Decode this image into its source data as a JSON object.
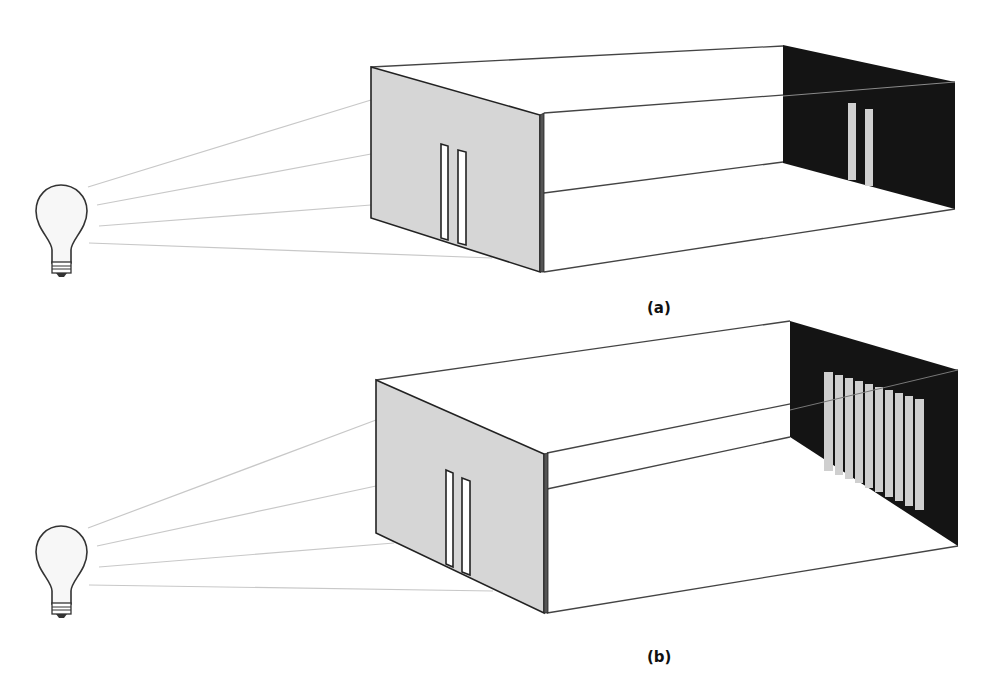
{
  "figure": {
    "panels": [
      {
        "id": "a",
        "label": "(a)",
        "front_barrier_slits": 2,
        "back_screen_bright_bands": 2,
        "description": "Light bulb illuminating a double-slit barrier; the back screen shows two bright bands"
      },
      {
        "id": "b",
        "label": "(b)",
        "front_barrier_slits": 2,
        "back_screen_bright_bands": 9,
        "description": "Light bulb illuminating a double-slit barrier; the back screen shows an interference pattern of many bands"
      }
    ],
    "colors": {
      "barrier": "#d6d6d6",
      "barrier_edge": "#2a2a2a",
      "screen": "#111111",
      "bands": "#cfcfcf",
      "rays": "#c8c8c8",
      "outline": "#333333"
    }
  }
}
